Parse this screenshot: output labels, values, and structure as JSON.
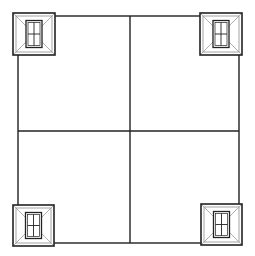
{
  "diagram": {
    "type": "plan-view",
    "canvas": {
      "width": 255,
      "height": 256,
      "background": "#ffffff"
    },
    "stroke_color": "#222222",
    "light_stroke_color": "#9a9a9a",
    "main_square": {
      "x": 18,
      "y": 16,
      "width": 221,
      "height": 227
    },
    "dividers": {
      "vertical_x": 130,
      "horizontal_y": 131
    },
    "corner_elements": [
      {
        "position": "top-left",
        "x": 13,
        "y": 13,
        "size": 42
      },
      {
        "position": "top-right",
        "x": 200,
        "y": 13,
        "size": 42
      },
      {
        "position": "bottom-left",
        "x": 13,
        "y": 205,
        "size": 41
      },
      {
        "position": "bottom-right",
        "x": 201,
        "y": 204,
        "size": 41
      }
    ]
  }
}
